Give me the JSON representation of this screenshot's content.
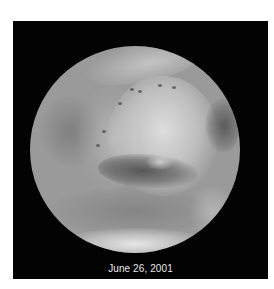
{
  "figure": {
    "caption": "June 26, 2001",
    "colors": {
      "page_background": "#ffffff",
      "panel_background": "#030303",
      "caption_text": "#e8e8e8"
    }
  }
}
